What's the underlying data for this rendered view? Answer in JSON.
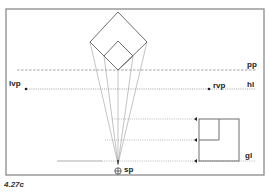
{
  "figure": {
    "caption": "4.27c",
    "frame": {
      "x": 6,
      "y": 9,
      "w": 258,
      "h": 166,
      "color": "#8a8a8a"
    },
    "line_color": "#6e6e6e",
    "construction_color": "#9a9a9a"
  },
  "labels": {
    "picture_plane": "pp",
    "horizon_line": "hl",
    "ground_line": "gl",
    "left_vanishing_point": "lvp",
    "right_vanishing_point": "rvp",
    "station_point": "sp"
  },
  "geometry": {
    "outer_square_top_view": [
      [
        118,
        12
      ],
      [
        147,
        42
      ],
      [
        118,
        70
      ],
      [
        90,
        42
      ]
    ],
    "inner_square_top_view": [
      [
        118,
        41
      ],
      [
        133,
        56
      ],
      [
        118,
        70
      ],
      [
        104,
        56
      ]
    ],
    "station_point": [
      118,
      164
    ],
    "pp_y": 70,
    "hl_y": 89,
    "gl_y": 161,
    "lvp": [
      26,
      89
    ],
    "rvp": [
      209,
      89
    ],
    "elevation_outer": {
      "x": 199,
      "y": 119,
      "w": 40,
      "h": 42
    },
    "elevation_inner_corner": [
      219,
      140
    ],
    "height_lines_y": [
      119,
      140,
      161
    ]
  }
}
